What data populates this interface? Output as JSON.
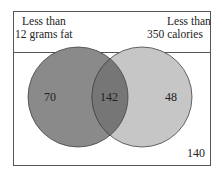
{
  "diagram": {
    "type": "venn",
    "sets": [
      {
        "label_line1": "Less than",
        "label_line2": "12 grams fat",
        "only_count": "70",
        "color": "#8a8a8a"
      },
      {
        "label_line1": "Less than",
        "label_line2": "350 calories",
        "only_count": "48",
        "color": "#c4c4c4"
      }
    ],
    "intersection_count": "142",
    "outside_count": "140",
    "colors": {
      "border": "#555555",
      "overlap": "#757575",
      "background": "#ffffff"
    }
  }
}
